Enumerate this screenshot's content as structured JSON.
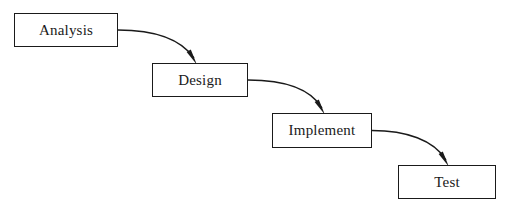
{
  "diagram": {
    "type": "flowchart",
    "background_color": "#ffffff",
    "stroke_color": "#1a1a1a",
    "fill_color": "#ffffff",
    "canvas": {
      "width": 515,
      "height": 214
    },
    "nodes": [
      {
        "id": "analysis",
        "label": "Analysis",
        "x": 14,
        "y": 13,
        "width": 104,
        "height": 34
      },
      {
        "id": "design",
        "label": "Design",
        "x": 152,
        "y": 63,
        "width": 96,
        "height": 34
      },
      {
        "id": "implement",
        "label": "Implement",
        "x": 272,
        "y": 113,
        "width": 100,
        "height": 35
      },
      {
        "id": "test",
        "label": "Test",
        "x": 398,
        "y": 165,
        "width": 98,
        "height": 34
      }
    ],
    "edges": [
      {
        "id": "analysis-to-design",
        "from": "analysis",
        "to": "design",
        "from_label": "Analysis",
        "to_label": "Design",
        "path": "M 118 30 C 152 30, 180 38, 194 58",
        "arrowhead": "M 196.8 64.4 L 186.6 52.0 L 190.8 49.6 Z"
      },
      {
        "id": "design-to-implement",
        "from": "design",
        "to": "implement",
        "from_label": "Design",
        "to_label": "Implement",
        "path": "M 248 80 C 282 80, 310 88, 322 108",
        "arrowhead": "M 324.8 114.4 L 314.6 102.0 L 318.8 99.6 Z"
      },
      {
        "id": "implement-to-test",
        "from": "implement",
        "to": "test",
        "from_label": "Implement",
        "to_label": "Test",
        "path": "M 372 130.5 C 406 130.5, 434 140, 446 160",
        "arrowhead": "M 448.8 166.4 L 438.6 154.0 L 442.8 151.6 Z"
      }
    ]
  }
}
